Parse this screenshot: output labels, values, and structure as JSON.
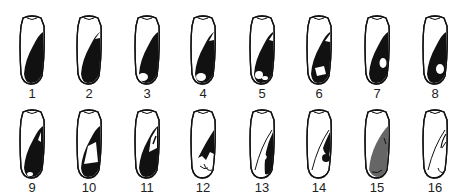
{
  "figure": {
    "rows": [
      {
        "items": [
          {
            "label": "1",
            "pattern": "dark-distal-full"
          },
          {
            "label": "2",
            "pattern": "dark-distal-notch"
          },
          {
            "label": "3",
            "pattern": "dark-distal-light-tip"
          },
          {
            "label": "4",
            "pattern": "dark-distal-light-tip-notch"
          },
          {
            "label": "5",
            "pattern": "dark-distal-two-spots"
          },
          {
            "label": "6",
            "pattern": "dark-distal-cutout"
          },
          {
            "label": "7",
            "pattern": "dark-distal-oval-spot"
          },
          {
            "label": "8",
            "pattern": "dark-distal-oval-spot-low"
          }
        ]
      },
      {
        "items": [
          {
            "label": "9",
            "pattern": "dark-distal-inner-mark"
          },
          {
            "label": "10",
            "pattern": "dark-distal-large-cutout"
          },
          {
            "label": "11",
            "pattern": "dark-distal-streak"
          },
          {
            "label": "12",
            "pattern": "dark-wedge-mid"
          },
          {
            "label": "13",
            "pattern": "dark-band-outline"
          },
          {
            "label": "14",
            "pattern": "dark-band-cutout"
          },
          {
            "label": "15",
            "pattern": "shaded-gray-band"
          },
          {
            "label": "16",
            "pattern": "outline-only"
          }
        ]
      }
    ],
    "colors": {
      "ink": "#111111",
      "shade": "#666666",
      "background": "#ffffff"
    }
  }
}
